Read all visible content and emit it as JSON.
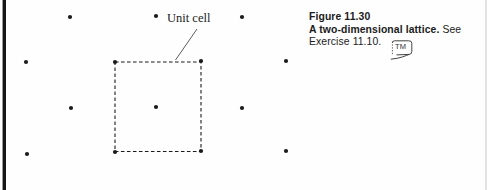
{
  "figure": {
    "unit_cell_label": "Unit cell",
    "caption": {
      "figure_number": "Figure 11.30",
      "title_bold": "A two-dimensional lattice.",
      "title_suffix": " See",
      "line3": "Exercise 11.10.",
      "media_icon_text": "TM"
    },
    "colors": {
      "ink": "#1b1b1b",
      "leader": "#4a4a4a"
    },
    "lattice": {
      "dot_radius": 2.1,
      "dots": [
        [
          70,
          17
        ],
        [
          156,
          16
        ],
        [
          242,
          17
        ],
        [
          26,
          62
        ],
        [
          115,
          62
        ],
        [
          201,
          61
        ],
        [
          286,
          61
        ],
        [
          71,
          108
        ],
        [
          156,
          107
        ],
        [
          242,
          108
        ],
        [
          27,
          154
        ],
        [
          115,
          152
        ],
        [
          201,
          151
        ],
        [
          286,
          151
        ]
      ],
      "unit_cell": {
        "x": 115,
        "y": 62,
        "w": 86,
        "h": 89.5
      },
      "leader_line": {
        "x1": 197,
        "y1": 29,
        "x2": 175.5,
        "y2": 60
      }
    }
  }
}
